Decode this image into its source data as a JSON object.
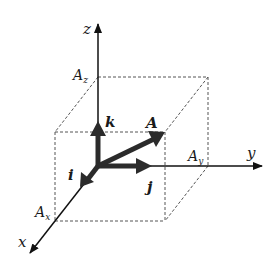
{
  "diagram": {
    "axes": {
      "x": {
        "label": "x"
      },
      "y": {
        "label": "y"
      },
      "z": {
        "label": "z"
      }
    },
    "components": {
      "Ax": {
        "base": "A",
        "sub": "x"
      },
      "Ay": {
        "base": "A",
        "sub": "y"
      },
      "Az": {
        "base": "A",
        "sub": "z"
      }
    },
    "unit_vectors": {
      "i": "i",
      "j": "j",
      "k": "k"
    },
    "vector": {
      "label": "A"
    },
    "colors": {
      "axis": "#111111",
      "vector": "#2b2b2b",
      "dashed": "#555555",
      "background": "#ffffff"
    }
  }
}
